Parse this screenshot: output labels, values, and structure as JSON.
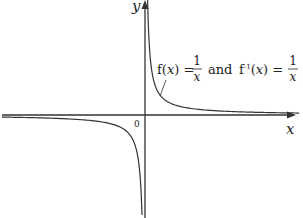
{
  "diagram": {
    "type": "function-graph",
    "function": "1/x",
    "axes": {
      "x_label": "x",
      "y_label": "y",
      "origin_label": "0"
    },
    "annotation": {
      "f_part": "f(",
      "x_var": "x",
      "close_eq": ") =",
      "numerator": "1",
      "denominator": "x",
      "and": "and",
      "finv_part": "f",
      "superscript": "-1",
      "finv_open": "(",
      "finv_close": ") ="
    },
    "colors": {
      "axis": "#333333",
      "curve": "#333333",
      "text": "#222222"
    }
  }
}
